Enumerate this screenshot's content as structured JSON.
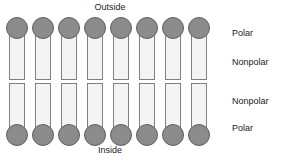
{
  "diagram": {
    "title_top": "Outside",
    "title_bottom": "Inside",
    "labels": {
      "polar_top": "Polar",
      "nonpolar_top": "Nonpolar",
      "nonpolar_bottom": "Nonpolar",
      "polar_bottom": "Polar"
    },
    "colors": {
      "head_fill": "#8b8b8b",
      "head_stroke": "#5f5f5f",
      "tail_fill": "#f4f4f4",
      "tail_stroke": "#808080",
      "text": "#1a1a1a",
      "background": "#ffffff"
    },
    "layout": {
      "lipid_count_per_leaflet": 8,
      "lipid_spacing_px": 26,
      "first_lipid_x_px": 6,
      "outer_leaflet_y_px": 17,
      "inner_leaflet_y_px": 82
    },
    "lipids_outer": [
      {
        "index": 1
      },
      {
        "index": 2
      },
      {
        "index": 3
      },
      {
        "index": 4
      },
      {
        "index": 5
      },
      {
        "index": 6
      },
      {
        "index": 7
      },
      {
        "index": 8
      }
    ],
    "lipids_inner": [
      {
        "index": 1
      },
      {
        "index": 2
      },
      {
        "index": 3
      },
      {
        "index": 4
      },
      {
        "index": 5
      },
      {
        "index": 6
      },
      {
        "index": 7
      },
      {
        "index": 8
      }
    ]
  }
}
